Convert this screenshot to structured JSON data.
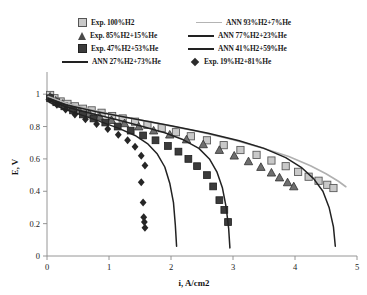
{
  "chart_data": {
    "type": "scatter",
    "title": "",
    "xlabel": "i, A/cm2",
    "ylabel": "E, V",
    "xlim": [
      0,
      5
    ],
    "ylim": [
      0,
      1.1
    ],
    "xticks": [
      "0",
      "1",
      "2",
      "3",
      "4",
      "5"
    ],
    "yticks": [
      "0",
      "0.2",
      "0.4",
      "0.6",
      "0.8",
      "1"
    ],
    "grid": false,
    "legend_position": "top",
    "series": [
      {
        "name": "Exp. 100%H2",
        "kind": "scatter",
        "marker": "square-open",
        "color": "#c9c9c9",
        "points": [
          [
            0.05,
            0.995
          ],
          [
            0.12,
            0.975
          ],
          [
            0.22,
            0.955
          ],
          [
            0.33,
            0.94
          ],
          [
            0.45,
            0.925
          ],
          [
            0.58,
            0.91
          ],
          [
            0.72,
            0.9
          ],
          [
            0.88,
            0.885
          ],
          [
            1.05,
            0.865
          ],
          [
            1.22,
            0.85
          ],
          [
            1.42,
            0.83
          ],
          [
            1.62,
            0.81
          ],
          [
            1.85,
            0.79
          ],
          [
            2.08,
            0.765
          ],
          [
            2.32,
            0.74
          ],
          [
            2.58,
            0.715
          ],
          [
            2.85,
            0.685
          ],
          [
            3.12,
            0.655
          ],
          [
            3.38,
            0.625
          ],
          [
            3.62,
            0.59
          ],
          [
            3.85,
            0.555
          ],
          [
            4.05,
            0.52
          ],
          [
            4.22,
            0.49
          ],
          [
            4.38,
            0.465
          ],
          [
            4.52,
            0.44
          ],
          [
            4.62,
            0.42
          ]
        ]
      },
      {
        "name": "Exp. 85%H2+15%He",
        "kind": "scatter",
        "marker": "triangle",
        "color": "#6e6e6e",
        "points": [
          [
            0.05,
            0.985
          ],
          [
            0.14,
            0.96
          ],
          [
            0.25,
            0.94
          ],
          [
            0.38,
            0.92
          ],
          [
            0.52,
            0.9
          ],
          [
            0.68,
            0.88
          ],
          [
            0.85,
            0.86
          ],
          [
            1.04,
            0.84
          ],
          [
            1.25,
            0.82
          ],
          [
            1.48,
            0.8
          ],
          [
            1.72,
            0.775
          ],
          [
            1.98,
            0.75
          ],
          [
            2.25,
            0.72
          ],
          [
            2.52,
            0.69
          ],
          [
            2.78,
            0.655
          ],
          [
            3.02,
            0.62
          ],
          [
            3.25,
            0.585
          ],
          [
            3.45,
            0.55
          ],
          [
            3.62,
            0.515
          ],
          [
            3.75,
            0.485
          ],
          [
            3.88,
            0.455
          ],
          [
            3.98,
            0.43
          ]
        ]
      },
      {
        "name": "Exp. 47%H2+53%He",
        "kind": "scatter",
        "marker": "square-filled",
        "color": "#3b3b3b",
        "points": [
          [
            0.05,
            0.975
          ],
          [
            0.15,
            0.95
          ],
          [
            0.28,
            0.925
          ],
          [
            0.42,
            0.9
          ],
          [
            0.58,
            0.875
          ],
          [
            0.75,
            0.85
          ],
          [
            0.94,
            0.825
          ],
          [
            1.14,
            0.8
          ],
          [
            1.35,
            0.775
          ],
          [
            1.55,
            0.745
          ],
          [
            1.75,
            0.715
          ],
          [
            1.95,
            0.68
          ],
          [
            2.12,
            0.645
          ],
          [
            2.28,
            0.6
          ],
          [
            2.42,
            0.555
          ],
          [
            2.58,
            0.5
          ],
          [
            2.68,
            0.43
          ],
          [
            2.78,
            0.345
          ],
          [
            2.86,
            0.285
          ],
          [
            2.92,
            0.21
          ]
        ]
      },
      {
        "name": "Exp. 19%H2+81%He",
        "kind": "scatter",
        "marker": "diamond",
        "color": "#262626",
        "points": [
          [
            0.05,
            0.965
          ],
          [
            0.16,
            0.935
          ],
          [
            0.3,
            0.905
          ],
          [
            0.45,
            0.875
          ],
          [
            0.62,
            0.845
          ],
          [
            0.8,
            0.815
          ],
          [
            0.98,
            0.785
          ],
          [
            1.15,
            0.75
          ],
          [
            1.3,
            0.715
          ],
          [
            1.42,
            0.675
          ],
          [
            1.52,
            0.62
          ],
          [
            1.58,
            0.56
          ],
          [
            1.52,
            0.455
          ],
          [
            1.55,
            0.33
          ],
          [
            1.56,
            0.24
          ],
          [
            1.57,
            0.21
          ],
          [
            1.58,
            0.175
          ]
        ]
      },
      {
        "name": "ANN 93%H2+7%He",
        "kind": "line",
        "color": "#b0b0b0",
        "width": 1.6,
        "points": [
          [
            0.02,
            0.985
          ],
          [
            0.3,
            0.945
          ],
          [
            0.7,
            0.905
          ],
          [
            1.2,
            0.862
          ],
          [
            1.8,
            0.818
          ],
          [
            2.4,
            0.772
          ],
          [
            3.0,
            0.718
          ],
          [
            3.5,
            0.665
          ],
          [
            3.9,
            0.615
          ],
          [
            4.25,
            0.558
          ],
          [
            4.5,
            0.508
          ],
          [
            4.7,
            0.462
          ],
          [
            4.82,
            0.428
          ]
        ]
      },
      {
        "name": "ANN 77%H2+23%He",
        "kind": "line",
        "color": "#222222",
        "width": 1.5,
        "points": [
          [
            0.02,
            0.975
          ],
          [
            0.3,
            0.935
          ],
          [
            0.8,
            0.892
          ],
          [
            1.4,
            0.848
          ],
          [
            2.0,
            0.805
          ],
          [
            2.6,
            0.758
          ],
          [
            3.1,
            0.712
          ],
          [
            3.5,
            0.665
          ],
          [
            3.85,
            0.608
          ],
          [
            4.1,
            0.548
          ],
          [
            4.3,
            0.478
          ],
          [
            4.45,
            0.4
          ],
          [
            4.55,
            0.3
          ],
          [
            4.62,
            0.18
          ],
          [
            4.65,
            0.06
          ]
        ]
      },
      {
        "name": "ANN 41%H2+59%He",
        "kind": "line",
        "color": "#222222",
        "width": 1.5,
        "points": [
          [
            0.02,
            0.965
          ],
          [
            0.3,
            0.922
          ],
          [
            0.7,
            0.882
          ],
          [
            1.1,
            0.845
          ],
          [
            1.5,
            0.805
          ],
          [
            1.9,
            0.762
          ],
          [
            2.2,
            0.718
          ],
          [
            2.45,
            0.665
          ],
          [
            2.62,
            0.6
          ],
          [
            2.74,
            0.52
          ],
          [
            2.83,
            0.42
          ],
          [
            2.89,
            0.3
          ],
          [
            2.93,
            0.17
          ],
          [
            2.95,
            0.05
          ]
        ]
      },
      {
        "name": "ANN 27%H2+73%He",
        "kind": "line",
        "color": "#222222",
        "width": 1.5,
        "points": [
          [
            0.02,
            0.955
          ],
          [
            0.25,
            0.912
          ],
          [
            0.55,
            0.872
          ],
          [
            0.85,
            0.832
          ],
          [
            1.15,
            0.79
          ],
          [
            1.42,
            0.745
          ],
          [
            1.62,
            0.695
          ],
          [
            1.78,
            0.63
          ],
          [
            1.9,
            0.55
          ],
          [
            1.98,
            0.45
          ],
          [
            2.04,
            0.33
          ],
          [
            2.07,
            0.19
          ],
          [
            2.09,
            0.06
          ]
        ]
      }
    ]
  },
  "legend": {
    "rows": [
      [
        {
          "marker": "square-open",
          "label": "Exp. 100%H2"
        },
        {
          "marker": "line-gray",
          "label": "ANN 93%H2+7%He"
        }
      ],
      [
        {
          "marker": "triangle",
          "label": "Exp. 85%H2+15%He"
        },
        {
          "marker": "line-dark",
          "label": "ANN 77%H2+23%He"
        }
      ],
      [
        {
          "marker": "square-filled",
          "label": "Exp. 47%H2+53%He"
        },
        {
          "marker": "line-dark",
          "label": "ANN 41%H2+59%He"
        }
      ],
      [
        {
          "marker": "line-dark",
          "label": "ANN 27%H2+73%He"
        },
        {
          "marker": "diamond",
          "label": "Exp. 19%H2+81%He"
        }
      ]
    ]
  },
  "colors": {
    "light_gray": "#b0b0b0",
    "dark": "#222222",
    "marker_open": "#c9c9c9",
    "marker_fill": "#3b3b3b",
    "axis": "#8a8a8a"
  }
}
